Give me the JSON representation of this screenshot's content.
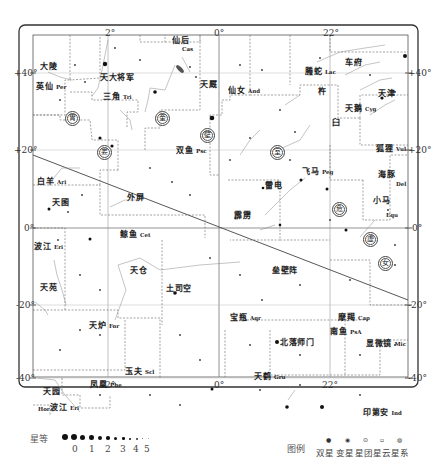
{
  "chart": {
    "ra_labels_top": [
      "2h",
      "0h",
      "22h"
    ],
    "ra_labels_bottom": [
      "2h",
      "0h",
      "22h"
    ],
    "dec_labels_left": [
      "+40°",
      "+20°",
      "0°",
      "-20°",
      "-40°"
    ],
    "dec_labels_right": [
      "+40°",
      "+20°",
      "0°",
      "-20°",
      "-40°"
    ],
    "axis": {
      "ra_top": {
        "2": "2",
        "0": "0",
        "22": "22"
      },
      "dec": {
        "p40": "+40",
        "p20": "+20",
        "z": "0",
        "m20": "-20",
        "m40": "-40"
      }
    }
  },
  "constellations": [
    {
      "cn": "英仙",
      "abbr": "Per"
    },
    {
      "cn": "大陵",
      "abbr": ""
    },
    {
      "cn": "天大将军",
      "abbr": ""
    },
    {
      "cn": "仙后",
      "abbr": "Cas"
    },
    {
      "cn": "天厩",
      "abbr": ""
    },
    {
      "cn": "三角",
      "abbr": "Tri"
    },
    {
      "cn": "仙女",
      "abbr": "And"
    },
    {
      "cn": "螣蛇",
      "abbr": "Lac"
    },
    {
      "cn": "车府",
      "abbr": ""
    },
    {
      "cn": "天津",
      "abbr": ""
    },
    {
      "cn": "天鹅",
      "abbr": "Cyg"
    },
    {
      "cn": "双鱼",
      "abbr": "Psc"
    },
    {
      "cn": "白羊",
      "abbr": "Ari"
    },
    {
      "cn": "天囷",
      "abbr": ""
    },
    {
      "cn": "外屏",
      "abbr": ""
    },
    {
      "cn": "雷电",
      "abbr": ""
    },
    {
      "cn": "飞马",
      "abbr": "Peg"
    },
    {
      "cn": "霹雳",
      "abbr": ""
    },
    {
      "cn": "小马",
      "abbr": "Equ"
    },
    {
      "cn": "狐狸",
      "abbr": "Vul"
    },
    {
      "cn": "海豚",
      "abbr": "Del"
    },
    {
      "cn": "鲸鱼",
      "abbr": "Cet"
    },
    {
      "cn": "波江",
      "abbr": "Eri"
    },
    {
      "cn": "天苑",
      "abbr": ""
    },
    {
      "cn": "天仓",
      "abbr": ""
    },
    {
      "cn": "土司空",
      "abbr": ""
    },
    {
      "cn": "垒壁阵",
      "abbr": ""
    },
    {
      "cn": "宝瓶",
      "abbr": "Aqr"
    },
    {
      "cn": "摩羯",
      "abbr": "Cap"
    },
    {
      "cn": "天炉",
      "abbr": "For"
    },
    {
      "cn": "玉夫",
      "abbr": "Scl"
    },
    {
      "cn": "南鱼",
      "abbr": "PsA"
    },
    {
      "cn": "显微镜",
      "abbr": "Mic"
    },
    {
      "cn": "北落师门",
      "abbr": ""
    },
    {
      "cn": "天鹤",
      "abbr": "Gru"
    },
    {
      "cn": "凤凰",
      "abbr": "Phe"
    },
    {
      "cn": "天园",
      "abbr": ""
    },
    {
      "cn": "波江",
      "abbr": "Eri"
    },
    {
      "cn": "时钟",
      "abbr": "Hor"
    },
    {
      "cn": "印第安",
      "abbr": "Ind"
    },
    {
      "cn": "杵",
      "abbr": ""
    },
    {
      "cn": "臼",
      "abbr": ""
    },
    {
      "cn": "外屏",
      "abbr": ""
    }
  ],
  "mansions": [
    "胃",
    "娄",
    "奎",
    "壁",
    "室",
    "危",
    "虚",
    "女"
  ],
  "legend": {
    "magnitude_label": "星等",
    "magnitudes": [
      "0",
      "1",
      "2",
      "3",
      "4",
      "5"
    ],
    "symbols_label": "图例",
    "symbols": [
      "双星",
      "变星",
      "星团",
      "星云",
      "星系"
    ]
  }
}
